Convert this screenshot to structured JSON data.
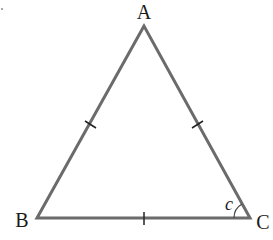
{
  "diagram": {
    "type": "equilateral-triangle",
    "colors": {
      "stroke": "#6b6b6b",
      "text": "#1a1a1a",
      "background": "#ffffff"
    },
    "vertices": {
      "A": {
        "label": "A",
        "x": 144,
        "y": 26
      },
      "B": {
        "label": "B",
        "x": 37,
        "y": 218
      },
      "C": {
        "label": "C",
        "x": 250,
        "y": 218
      }
    },
    "sides": [
      {
        "name": "AB",
        "tick_marks": 1
      },
      {
        "name": "AC",
        "tick_marks": 1
      },
      {
        "name": "BC",
        "tick_marks": 1
      }
    ],
    "angles": [
      {
        "vertex": "C",
        "label": "c"
      }
    ]
  }
}
